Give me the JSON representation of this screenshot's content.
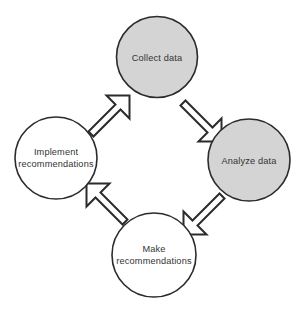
{
  "diagram": {
    "type": "cycle",
    "direction": "clockwise",
    "background_color": "#ffffff",
    "outline_color": "#2b2b2b",
    "text_color": "#333333",
    "shaded_fill": "#d4d4d4",
    "plain_fill": "#ffffff",
    "nodes": [
      {
        "id": "collect-data",
        "position": "top",
        "lines": [
          "Collect data"
        ],
        "fill": "#d4d4d4",
        "shaded": true,
        "cx": 157,
        "cy": 57,
        "r": 40.5
      },
      {
        "id": "analyze-data",
        "position": "right",
        "lines": [
          "Analyze data"
        ],
        "fill": "#d4d4d4",
        "shaded": true,
        "cx": 249,
        "cy": 160,
        "r": 41
      },
      {
        "id": "make-recommendations",
        "position": "bottom",
        "lines": [
          "Make",
          "recommendations"
        ],
        "fill": "#ffffff",
        "shaded": false,
        "cx": 154,
        "cy": 255,
        "r": 42
      },
      {
        "id": "implement-recommendations",
        "position": "left",
        "lines": [
          "Implement",
          "recommendations"
        ],
        "fill": "#ffffff",
        "shaded": false,
        "cx": 56,
        "cy": 158,
        "r": 41
      }
    ],
    "arrows": [
      {
        "id": "collect-to-analyze",
        "from": "collect-data",
        "to": "analyze-data",
        "direction": "down-right",
        "angle": 135
      },
      {
        "id": "analyze-to-make",
        "from": "analyze-data",
        "to": "make-recommendations",
        "direction": "down-left",
        "angle": 225
      },
      {
        "id": "make-to-implement",
        "from": "make-recommendations",
        "to": "implement-recommendations",
        "direction": "up-left",
        "angle": 315
      },
      {
        "id": "implement-to-collect",
        "from": "implement-recommendations",
        "to": "collect-data",
        "direction": "up-right",
        "angle": 45
      }
    ]
  }
}
